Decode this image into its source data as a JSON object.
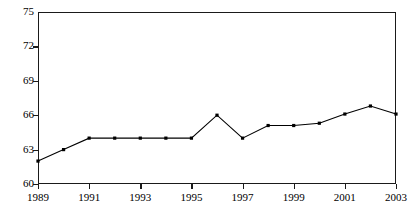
{
  "chart_data": {
    "type": "line",
    "title": "",
    "subtitle": "",
    "xlabel": "",
    "ylabel": "",
    "x": [
      1989,
      1990,
      1991,
      1992,
      1993,
      1994,
      1995,
      1996,
      1997,
      1998,
      1999,
      2000,
      2001,
      2002,
      2003
    ],
    "values": [
      62.0,
      63.0,
      64.0,
      64.0,
      64.0,
      64.0,
      64.0,
      66.0,
      64.0,
      65.1,
      65.1,
      65.3,
      66.1,
      66.8,
      66.1
    ],
    "series": [
      {
        "name": "series-1",
        "values": [
          62.0,
          63.0,
          64.0,
          64.0,
          64.0,
          64.0,
          64.0,
          66.0,
          64.0,
          65.1,
          65.1,
          65.3,
          66.1,
          66.8,
          66.1
        ]
      }
    ],
    "xlim": [
      1989,
      2003
    ],
    "ylim": [
      60,
      75
    ],
    "y_ticks": [
      60,
      63,
      66,
      69,
      72,
      75
    ],
    "y_tick_labels": [
      "60",
      "63",
      "66",
      "69",
      "72",
      "75"
    ],
    "x_ticks": [
      1989,
      1991,
      1993,
      1995,
      1997,
      1999,
      2001,
      2003
    ],
    "x_tick_labels": [
      "1989",
      "1991",
      "1993",
      "1995",
      "1997",
      "1999",
      "2001",
      "2003"
    ],
    "x_minor_ticks": [
      1989,
      1991,
      1993,
      1995,
      1997,
      1999,
      2001,
      2003
    ],
    "grid": false,
    "legend": false,
    "legend_position": "none",
    "marker": "square",
    "marker_color": "#000000",
    "line_color": "#000000",
    "line_width": 1,
    "frame": true,
    "frame_color": "#1a1a1a",
    "background": "#ffffff",
    "annotations": []
  }
}
